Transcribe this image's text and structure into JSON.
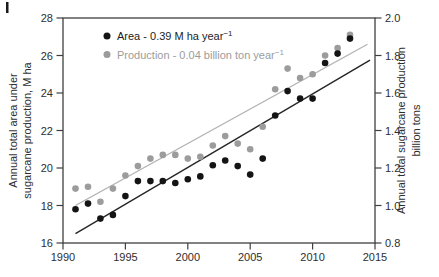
{
  "figure": {
    "width": 439,
    "height": 277,
    "background": "#ffffff",
    "frame_color": "#3f3f3f",
    "text_color": "#2e2e2e"
  },
  "chart_data": {
    "type": "scatter",
    "x": [
      1991,
      1992,
      1993,
      1994,
      1995,
      1996,
      1997,
      1998,
      1999,
      2000,
      2001,
      2002,
      2003,
      2004,
      2005,
      2006,
      2007,
      2008,
      2009,
      2010,
      2011,
      2012,
      2013
    ],
    "series": [
      {
        "name": "Area",
        "axis": "left",
        "color": "#141414",
        "values": [
          17.8,
          18.1,
          17.3,
          17.5,
          18.5,
          19.3,
          19.3,
          19.3,
          19.2,
          19.4,
          19.55,
          20.15,
          20.4,
          20.1,
          19.65,
          20.5,
          22.8,
          24.1,
          23.7,
          23.7,
          25.6,
          26.1,
          26.9
        ],
        "trend": {
          "start_year": 1991,
          "start_value": 16.5,
          "end_year": 2014.6,
          "end_value": 25.75,
          "color": "#262626"
        }
      },
      {
        "name": "Production",
        "axis": "right",
        "color": "#9c9c9c",
        "values": [
          1.09,
          1.1,
          1.02,
          1.09,
          1.16,
          1.21,
          1.25,
          1.27,
          1.27,
          1.25,
          1.26,
          1.32,
          1.37,
          1.33,
          1.3,
          1.42,
          1.62,
          1.73,
          1.68,
          1.7,
          1.8,
          1.84,
          1.91
        ],
        "trend": {
          "start_year": 1991,
          "start_value": 1.0,
          "end_year": 2014.4,
          "end_value": 1.86,
          "color": "#b3b3b3"
        }
      }
    ],
    "legend": {
      "position": "top-left-inside",
      "items": [
        {
          "label": "Area - 0.39 M ha year",
          "sup": "−1",
          "color": "#141414",
          "text_color": "#1c1c1c"
        },
        {
          "label": "Production - 0.04 billion ton year",
          "sup": "−1",
          "color": "#9c9c9c",
          "text_color": "#9c9c9c"
        }
      ]
    },
    "axes": {
      "x": {
        "min": 1990,
        "max": 2015,
        "ticks": [
          "1990",
          "1995",
          "2000",
          "2005",
          "2010",
          "2015"
        ],
        "tick_values": [
          1990,
          1995,
          2000,
          2005,
          2010,
          2015
        ],
        "label": ""
      },
      "y_left": {
        "min": 16,
        "max": 28,
        "ticks": [
          "16",
          "18",
          "20",
          "22",
          "24",
          "26",
          "28"
        ],
        "tick_values": [
          16,
          18,
          20,
          22,
          24,
          26,
          28
        ],
        "title_line1": "Annual total area under",
        "title_line2": "sugarcane production, M ha"
      },
      "y_right": {
        "min": 0.8,
        "max": 2.0,
        "ticks": [
          "0.8",
          "1.0",
          "1.2",
          "1.4",
          "1.6",
          "1.8",
          "2.0"
        ],
        "tick_values": [
          0.8,
          1.0,
          1.2,
          1.4,
          1.6,
          1.8,
          2.0
        ],
        "title_line1": "Annual total sugarcane production",
        "title_line2": "billion tons"
      }
    },
    "plot_area": {
      "left": 63,
      "right": 375,
      "top": 18,
      "bottom": 243
    },
    "grid": false,
    "dot_radius": 3.3
  }
}
